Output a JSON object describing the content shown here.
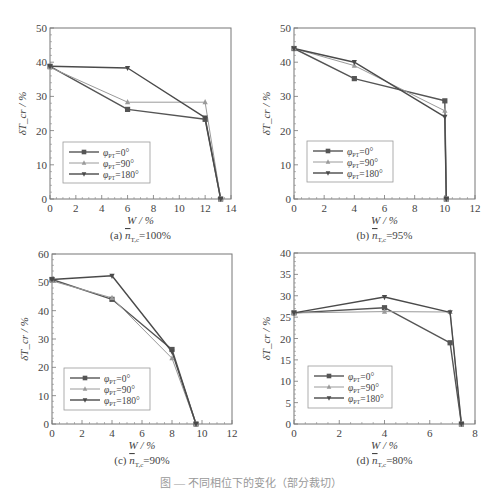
{
  "figure": {
    "caption": "图 — 不同相位下的变化（部分裁切）"
  },
  "legend_labels": [
    "φ_PT=0°",
    "φ_PT=90°",
    "φ_PT=180°"
  ],
  "series_styles": [
    {
      "name": "φ_PT=0°",
      "color": "#555555",
      "marker": "square",
      "width": 1.4
    },
    {
      "name": "φ_PT=90°",
      "color": "#9a9a9a",
      "marker": "triangle-up",
      "width": 1.0
    },
    {
      "name": "φ_PT=180°",
      "color": "#4a4a4a",
      "marker": "triangle-down",
      "width": 1.4
    }
  ],
  "chart_data": [
    {
      "id": "a",
      "type": "line",
      "title": "(a) n̄_T,c=100%",
      "subtitle_prefix": "(a)",
      "subtitle_var": "n",
      "subtitle_sub": "T,c",
      "subtitle_value": "=100%",
      "xlabel": "W / %",
      "ylabel": "δT_cr / %",
      "xlim": [
        0,
        14
      ],
      "ylim": [
        0,
        50
      ],
      "xticks": [
        0,
        2,
        4,
        6,
        8,
        10,
        12,
        14
      ],
      "yticks": [
        0,
        10,
        20,
        30,
        40,
        50
      ],
      "grid": false,
      "legend_position": "lower-left",
      "box": {
        "x0": 50,
        "y0": 28,
        "x1": 231,
        "y1": 199
      },
      "legend_box": {
        "x": 63,
        "y": 142,
        "w": 87,
        "h": 41
      },
      "series": [
        {
          "name": "φ_PT=0°",
          "x": [
            0,
            6,
            12,
            13.2
          ],
          "y": [
            38.8,
            26.2,
            23.3,
            0
          ]
        },
        {
          "name": "φ_PT=90°",
          "x": [
            0,
            6,
            12,
            13.2
          ],
          "y": [
            38.5,
            28.3,
            28.3,
            0
          ]
        },
        {
          "name": "φ_PT=180°",
          "x": [
            0,
            6,
            12,
            13.2
          ],
          "y": [
            38.8,
            38.3,
            23.8,
            0
          ]
        }
      ]
    },
    {
      "id": "b",
      "type": "line",
      "title": "(b) n̄_T,c=95%",
      "subtitle_prefix": "(b)",
      "subtitle_var": "n",
      "subtitle_sub": "T,c",
      "subtitle_value": "=95%",
      "xlabel": "W / %",
      "ylabel": "δT_cr / %",
      "xlim": [
        0,
        12
      ],
      "ylim": [
        0,
        50
      ],
      "xticks": [
        0,
        2,
        4,
        6,
        8,
        10,
        12
      ],
      "yticks": [
        0,
        10,
        20,
        30,
        40,
        50
      ],
      "grid": false,
      "legend_position": "lower-left",
      "box": {
        "x0": 294,
        "y0": 28,
        "x1": 475,
        "y1": 199
      },
      "legend_box": {
        "x": 307,
        "y": 141,
        "w": 86,
        "h": 41
      },
      "series": [
        {
          "name": "φ_PT=0°",
          "x": [
            0,
            4,
            10,
            10.1
          ],
          "y": [
            44,
            35.2,
            28.7,
            0
          ]
        },
        {
          "name": "φ_PT=90°",
          "x": [
            0,
            4,
            10,
            10.1
          ],
          "y": [
            44,
            39.0,
            25.8,
            0
          ]
        },
        {
          "name": "φ_PT=180°",
          "x": [
            0,
            4,
            10,
            10.1
          ],
          "y": [
            44,
            40.0,
            24.0,
            0
          ]
        }
      ]
    },
    {
      "id": "c",
      "type": "line",
      "title": "(c) n̄_T,c=90%",
      "subtitle_prefix": "(c)",
      "subtitle_var": "n",
      "subtitle_sub": "T,c",
      "subtitle_value": "=90%",
      "xlabel": "W / %",
      "ylabel": "δT_cr / %",
      "xlim": [
        0,
        12
      ],
      "ylim": [
        0,
        60
      ],
      "xticks": [
        0,
        2,
        4,
        6,
        8,
        10,
        12
      ],
      "yticks": [
        0,
        10,
        20,
        30,
        40,
        50,
        60
      ],
      "grid": false,
      "legend_position": "lower-left",
      "box": {
        "x0": 52,
        "y0": 254,
        "x1": 232,
        "y1": 424
      },
      "legend_box": {
        "x": 64,
        "y": 368,
        "w": 86,
        "h": 42
      },
      "series": [
        {
          "name": "φ_PT=0°",
          "x": [
            0,
            4,
            8,
            9.6
          ],
          "y": [
            51,
            44.0,
            26.3,
            0
          ]
        },
        {
          "name": "φ_PT=90°",
          "x": [
            0,
            4,
            8,
            9.6
          ],
          "y": [
            50.5,
            44.5,
            23.2,
            0
          ]
        },
        {
          "name": "φ_PT=180°",
          "x": [
            0,
            4,
            8,
            9.6
          ],
          "y": [
            51,
            52.3,
            25.5,
            0
          ]
        }
      ]
    },
    {
      "id": "d",
      "type": "line",
      "title": "(d) n̄_T,c=80%",
      "subtitle_prefix": "(d)",
      "subtitle_var": "n",
      "subtitle_sub": "T,c",
      "subtitle_value": "=80%",
      "xlabel": "W / %",
      "ylabel": "δT_cr / %",
      "xlim": [
        0,
        8
      ],
      "ylim": [
        0,
        40
      ],
      "xticks": [
        0,
        2,
        4,
        6,
        8
      ],
      "yticks": [
        0,
        5,
        10,
        15,
        20,
        25,
        30,
        35,
        40
      ],
      "grid": false,
      "legend_position": "lower-left",
      "box": {
        "x0": 294,
        "y0": 253,
        "x1": 475,
        "y1": 424
      },
      "legend_box": {
        "x": 308,
        "y": 366,
        "w": 84,
        "h": 42
      },
      "series": [
        {
          "name": "φ_PT=0°",
          "x": [
            0,
            4,
            6.9,
            7.4
          ],
          "y": [
            26,
            27.2,
            19.0,
            0
          ]
        },
        {
          "name": "φ_PT=90°",
          "x": [
            0,
            4,
            6.9,
            7.4
          ],
          "y": [
            26,
            26.3,
            26.2,
            0
          ]
        },
        {
          "name": "φ_PT=180°",
          "x": [
            0,
            4,
            6.9,
            7.4
          ],
          "y": [
            26,
            29.7,
            26.1,
            0
          ]
        }
      ]
    }
  ]
}
